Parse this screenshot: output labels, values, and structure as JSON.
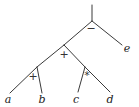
{
  "diagram": {
    "type": "expression-tree",
    "root_stem": {
      "x1": 92,
      "y1": 5,
      "x2": 92,
      "y2": 21
    },
    "nodes": [
      {
        "id": "n_minus",
        "op": "−",
        "x": 92,
        "y": 21,
        "label_x": 91,
        "label_y": 32
      },
      {
        "id": "n_plus_top",
        "op": "+",
        "x": 64,
        "y": 45,
        "label_x": 64,
        "label_y": 58
      },
      {
        "id": "n_plus_low",
        "op": "+",
        "x": 37,
        "y": 67,
        "label_x": 33,
        "label_y": 80
      },
      {
        "id": "n_times",
        "op": "*",
        "x": 85,
        "y": 67,
        "label_x": 87,
        "label_y": 79
      }
    ],
    "leaves": [
      {
        "id": "a",
        "label": "a",
        "x": 8,
        "y": 103
      },
      {
        "id": "b",
        "label": "b",
        "x": 42,
        "y": 103
      },
      {
        "id": "c",
        "label": "c",
        "x": 76,
        "y": 103
      },
      {
        "id": "d",
        "label": "d",
        "x": 110,
        "y": 103
      },
      {
        "id": "e",
        "label": "e",
        "x": 127,
        "y": 52
      }
    ],
    "edges": [
      {
        "from": "n_minus",
        "to": "n_plus_top",
        "x1": 92,
        "y1": 21,
        "x2": 64,
        "y2": 45
      },
      {
        "from": "n_minus",
        "to": "e",
        "x1": 92,
        "y1": 21,
        "x2": 122,
        "y2": 45
      },
      {
        "from": "n_plus_top",
        "to": "n_plus_low",
        "x1": 64,
        "y1": 45,
        "x2": 37,
        "y2": 67
      },
      {
        "from": "n_plus_top",
        "to": "n_times",
        "x1": 64,
        "y1": 45,
        "x2": 85,
        "y2": 67
      },
      {
        "from": "n_plus_low",
        "to": "a",
        "x1": 37,
        "y1": 67,
        "x2": 10,
        "y2": 93
      },
      {
        "from": "n_plus_low",
        "to": "b",
        "x1": 37,
        "y1": 67,
        "x2": 42,
        "y2": 93
      },
      {
        "from": "n_times",
        "to": "c",
        "x1": 85,
        "y1": 67,
        "x2": 78,
        "y2": 92
      },
      {
        "from": "n_times",
        "to": "d",
        "x1": 85,
        "y1": 67,
        "x2": 110,
        "y2": 92
      }
    ],
    "expression": "((a + b) + (c * d)) − e"
  }
}
